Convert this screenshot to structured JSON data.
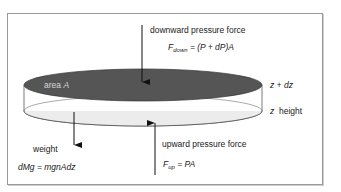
{
  "diagram": {
    "type": "hydrostatic-equilibrium-slab",
    "colors": {
      "frame": "#9a9a9a",
      "top_face": "#555555",
      "bottom_face": "#ececec",
      "outline": "#333333",
      "text": "#222222",
      "area_text": "#d8d8d8"
    },
    "top_label": {
      "title": "downward pressure force",
      "formula_F": "F",
      "formula_sub": "down",
      "formula_rest": " = (P + dP)A"
    },
    "area_label": {
      "text": "area ",
      "symbol": "A"
    },
    "right_labels": {
      "top": "z + dz",
      "bottom_z": "z",
      "bottom_word": "height"
    },
    "weight_label": {
      "title": "weight",
      "formula": "dMg = mgnAdz"
    },
    "bottom_label": {
      "title": "upward pressure force",
      "formula_F": "F",
      "formula_sub": "up",
      "formula_rest": " = PA"
    },
    "arrows": [
      {
        "name": "downward-pressure-arrow",
        "direction": "down"
      },
      {
        "name": "weight-arrow",
        "direction": "down"
      },
      {
        "name": "upward-pressure-arrow",
        "direction": "up"
      }
    ]
  }
}
